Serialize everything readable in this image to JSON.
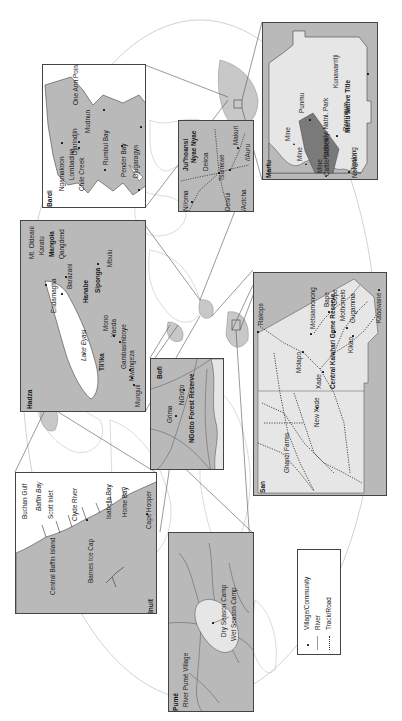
{
  "figure": {
    "orientation": "rotated-90-ccw",
    "background_world_map": "world-outline-ellipse"
  },
  "colors": {
    "land_inset": "#b9b9b9",
    "land_light": "#e6e6e6",
    "park_dark": "#7a7a7a",
    "outline": "#444444",
    "world_line": "#bdbdbd",
    "highlight_region": "#c8c8c8"
  },
  "legend": {
    "items": [
      {
        "symbol": "square-dot",
        "label": "Village/Community"
      },
      {
        "symbol": "solid-line",
        "label": "River"
      },
      {
        "symbol": "dotted-line",
        "label": "Track/Road"
      }
    ]
  },
  "insets": {
    "bardi": {
      "title": "Bardi",
      "labels": [
        "Ngamakoon",
        "Lombadina",
        "Chile Creek",
        "Djarindjin",
        "One Arm Point",
        "Mudnun",
        "Rumbul Bay",
        "Pender Bay",
        "Djugaragyn"
      ]
    },
    "martu": {
      "title": "Martu",
      "labels": [
        "Kunawarritji",
        "Martu Native Title",
        "Punmu",
        "Parnngurr",
        "Karlamilyi Natnl. Park",
        "Mine",
        "Mine",
        "Mine",
        "Jigalong",
        "Cattle Station",
        "Newman"
      ]
    },
    "juhoansi": {
      "title": "Ju/'hoansi",
      "labels": [
        "Nyae Nyae",
        "N//oma",
        "Dekoa",
        "Tsumkwe",
        "Den/ui",
        "/Aotcha",
        "Makuri",
        "//Auru"
      ]
    },
    "hadza": {
      "title": "Hadza",
      "labels": [
        "Mt. Oldeani",
        "Karatu",
        "Mangola",
        "Qangdend",
        "Endamagha",
        "Barazani",
        "Lake Eyasi",
        "Hanabe",
        "Siponga",
        "Mbulu",
        "Mono",
        "Yaeda",
        "Tli'ika",
        "Gambasimboye",
        "Mwangeza",
        "Munguli"
      ]
    },
    "san": {
      "title": "San",
      "labels": [
        "Rakops",
        "Metsiamonong",
        "Bape",
        "Gope",
        "Mothomelo",
        "Gugamma",
        "Kikao",
        "Kaudwane",
        "Molapo",
        "Xade",
        "Central Kalahari Game Reserve",
        "New Xade",
        "Ghanzi Farms"
      ]
    },
    "bofi": {
      "title": "Bofi",
      "labels": [
        "NGotto",
        "Grima",
        "NGotto Forest Reserve"
      ]
    },
    "inuit": {
      "title": "Inuit",
      "labels": [
        "Buchan Gulf",
        "Baffin Bay",
        "Scott Inlet",
        "Clyde River",
        "Isabella Bay",
        "Home Bay",
        "Cape Hooper",
        "Central Baffin Island",
        "Barnes Ice Cap"
      ]
    },
    "pume": {
      "title": "Pumé",
      "labels": [
        "River Pumé Village",
        "Dry Season Camp",
        "Wet Season Camp"
      ]
    }
  }
}
